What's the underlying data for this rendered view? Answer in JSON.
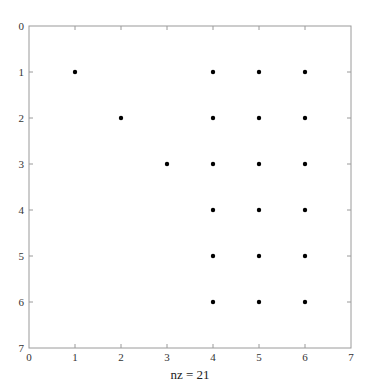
{
  "chart_data": {
    "type": "scatter",
    "subtype": "sparsity-pattern",
    "title": "",
    "xlabel": "nz = 21",
    "ylabel": "",
    "xlim": [
      0,
      7
    ],
    "ylim": [
      7,
      0
    ],
    "y_axis_reversed": true,
    "xticks": [
      0,
      1,
      2,
      3,
      4,
      5,
      6,
      7
    ],
    "yticks": [
      0,
      1,
      2,
      3,
      4,
      5,
      6,
      7
    ],
    "grid": false,
    "legend": null,
    "marker_color": "#000000",
    "nonzero_count": 21,
    "points": [
      {
        "x": 1,
        "y": 1
      },
      {
        "x": 4,
        "y": 1
      },
      {
        "x": 5,
        "y": 1
      },
      {
        "x": 6,
        "y": 1
      },
      {
        "x": 2,
        "y": 2
      },
      {
        "x": 4,
        "y": 2
      },
      {
        "x": 5,
        "y": 2
      },
      {
        "x": 6,
        "y": 2
      },
      {
        "x": 3,
        "y": 3
      },
      {
        "x": 4,
        "y": 3
      },
      {
        "x": 5,
        "y": 3
      },
      {
        "x": 6,
        "y": 3
      },
      {
        "x": 4,
        "y": 4
      },
      {
        "x": 5,
        "y": 4
      },
      {
        "x": 6,
        "y": 4
      },
      {
        "x": 4,
        "y": 5
      },
      {
        "x": 5,
        "y": 5
      },
      {
        "x": 6,
        "y": 5
      },
      {
        "x": 4,
        "y": 6
      },
      {
        "x": 5,
        "y": 6
      },
      {
        "x": 6,
        "y": 6
      }
    ]
  }
}
